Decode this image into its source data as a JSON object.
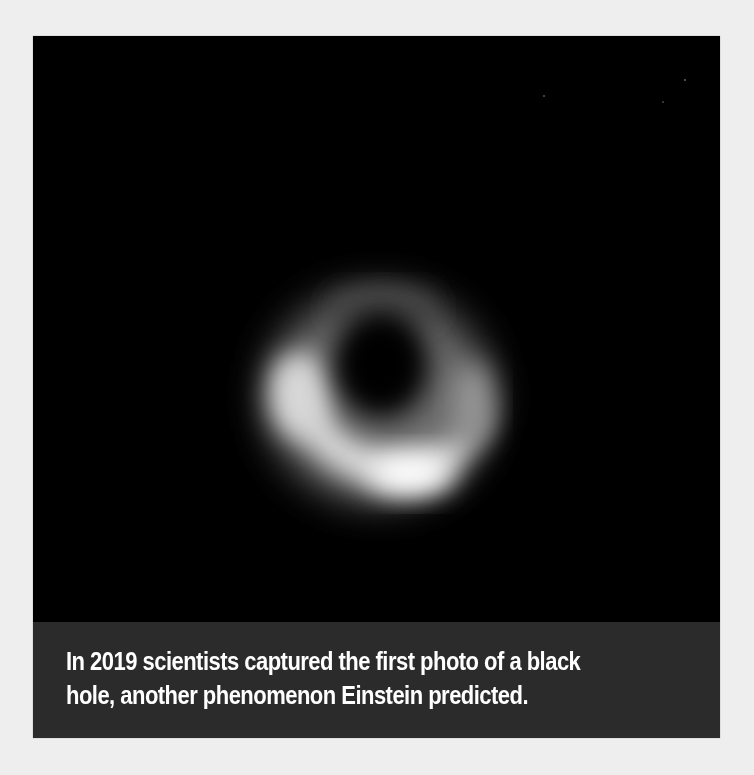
{
  "figure": {
    "image": {
      "subject": "black-hole-photo",
      "alt": "First image of a black hole: a glowing orange-white ring surrounding a dark center",
      "background_color": "#000000",
      "ring_color": "#ffffff"
    },
    "caption": {
      "text": "In 2019 scientists captured the first photo of a black hole, another phenomenon Einstein predicted.",
      "background_color": "#2b2b2b",
      "text_color": "#ffffff"
    }
  },
  "page": {
    "background_color": "#eeeeee"
  }
}
